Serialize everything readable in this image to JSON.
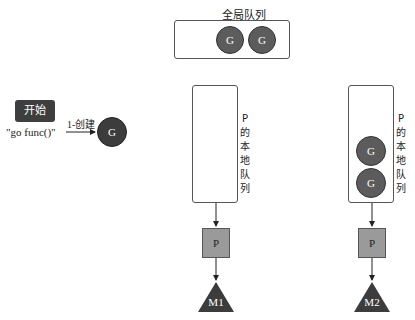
{
  "start": {
    "label": "开始",
    "code": "\"go func()\""
  },
  "create_edge": {
    "label": "1-创建"
  },
  "new_goroutine": {
    "label": "G"
  },
  "global_queue": {
    "title": "全局队列",
    "goroutines": [
      "G",
      "G"
    ]
  },
  "processors": [
    {
      "local_queue_label": "P的本地队列",
      "goroutines": [],
      "p_label": "P",
      "m_label": "M1"
    },
    {
      "local_queue_label": "P的本地队列",
      "goroutines": [
        "G",
        "G"
      ],
      "p_label": "P",
      "m_label": "M2"
    }
  ],
  "colors": {
    "goroutine": "#5c5c5c",
    "start": "#3e3e3e",
    "processor": "#9a9a9a",
    "machine": "#3c3c3c"
  }
}
